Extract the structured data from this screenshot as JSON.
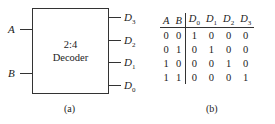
{
  "diagram_a": {
    "block_label_line1": "2:4",
    "block_label_line2": "Decoder",
    "inputs": [
      {
        "name": "A"
      },
      {
        "name": "B"
      }
    ],
    "outputs": [
      {
        "base": "D",
        "sub": "3"
      },
      {
        "base": "D",
        "sub": "2"
      },
      {
        "base": "D",
        "sub": "1"
      },
      {
        "base": "D",
        "sub": "0"
      }
    ],
    "caption": "(a)"
  },
  "table_b": {
    "headers": [
      {
        "base": "A",
        "sub": ""
      },
      {
        "base": "B",
        "sub": ""
      },
      {
        "base": "D",
        "sub": "0"
      },
      {
        "base": "D",
        "sub": "1"
      },
      {
        "base": "D",
        "sub": "2"
      },
      {
        "base": "D",
        "sub": "3"
      }
    ],
    "rows": [
      [
        "0",
        "0",
        "1",
        "0",
        "0",
        "0"
      ],
      [
        "0",
        "1",
        "0",
        "1",
        "0",
        "0"
      ],
      [
        "1",
        "0",
        "0",
        "0",
        "1",
        "0"
      ],
      [
        "1",
        "1",
        "0",
        "0",
        "0",
        "1"
      ]
    ],
    "caption": "(b)"
  }
}
